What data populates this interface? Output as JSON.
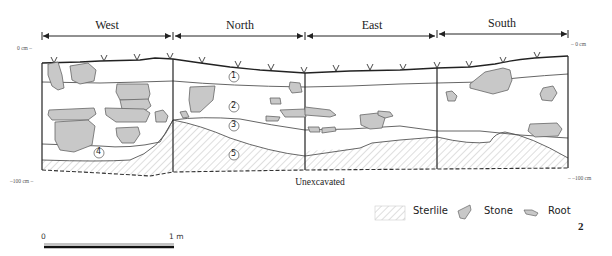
{
  "sections": [
    {
      "label": "West",
      "x_center": 107
    },
    {
      "label": "North",
      "x_center": 240
    },
    {
      "label": "East",
      "x_center": 372
    },
    {
      "label": "South",
      "x_center": 502
    }
  ],
  "depth_scale": {
    "top_left": "0 cm –",
    "top_right": "– 0 cm",
    "bottom_left": "–100 cm –",
    "bottom_right": "– –100 cm"
  },
  "layers": [
    "1",
    "2",
    "3",
    "4",
    "5"
  ],
  "unexcavated_label": "Unexcavated",
  "legend": {
    "items": [
      {
        "name": "sterile",
        "label": "Sterlile"
      },
      {
        "name": "stone",
        "label": "Stone"
      },
      {
        "name": "root",
        "label": "Root"
      }
    ]
  },
  "scale_bar": {
    "start": "0",
    "end": "1 m"
  },
  "figure_number": "2",
  "colors": {
    "stone_fill": "#c8c8c8",
    "stone_stroke": "#666666",
    "line": "#333333",
    "hatch": "#bfbfbf"
  }
}
